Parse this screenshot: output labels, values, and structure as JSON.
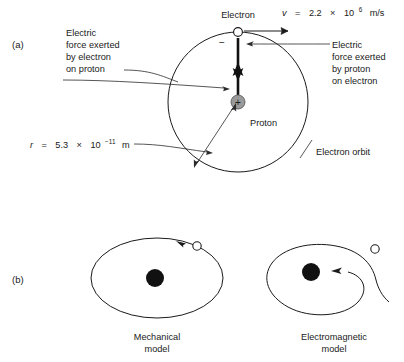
{
  "figure": {
    "panel_a": {
      "label": "(a)",
      "electron_label": "Electron",
      "electron_sign": "−",
      "proton_label": "Proton",
      "proton_sign": "+",
      "orbit_label": "Electron orbit",
      "velocity_label_parts": {
        "symbol": "v",
        "equals": "=",
        "mantissa": "2.2",
        "times": "×",
        "base": "10",
        "exponent": "6",
        "unit": "m/s"
      },
      "velocity_label_full": "v = 2.2 × 10⁶ m/s",
      "radius_label_parts": {
        "symbol": "r",
        "equals": "=",
        "mantissa": "5.3",
        "times": "×",
        "base": "10",
        "exponent": "−11",
        "unit": "m"
      },
      "radius_label_full": "r = 5.3 × 10⁻¹¹ m",
      "force_on_proton_lines": [
        "Electric",
        "force exerted",
        "by electron",
        "on proton"
      ],
      "force_on_electron_lines": [
        "Electric",
        "force exerted",
        "by proton",
        "on electron"
      ]
    },
    "panel_b": {
      "label": "(b)",
      "mechanical_model_caption_lines": [
        "Mechanical",
        "model"
      ],
      "electromagnetic_model_caption_lines": [
        "Electromagnetic",
        "model"
      ]
    },
    "colors": {
      "background": "#ffffff",
      "line": "#1a1a1a",
      "text": "#1a1a1a",
      "proton_fill": "#9a9a9a",
      "proton_stroke": "#4a4a4a",
      "electron_fill": "#ffffff",
      "electron_stroke": "#1a1a1a",
      "nucleus_fill": "#111111"
    }
  }
}
